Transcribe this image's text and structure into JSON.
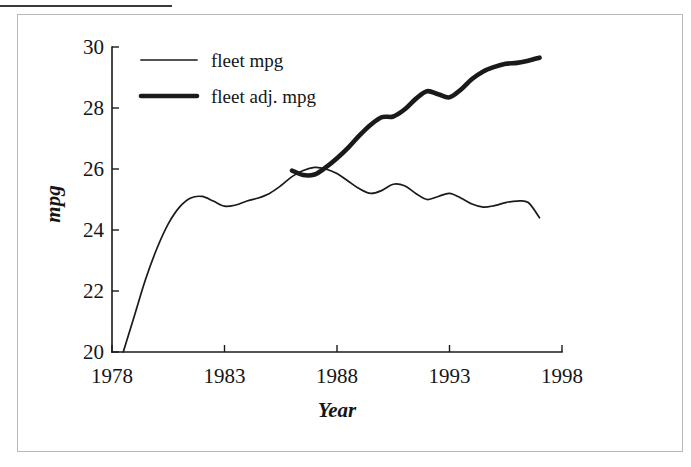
{
  "figure": {
    "background_color": "#ffffff",
    "frame_color": "#b9b9b9",
    "rule_color": "#3a3a3a",
    "ink_color": "#1a1a1a"
  },
  "legend": {
    "entries": [
      {
        "label": "fleet mpg",
        "style": "thin-line",
        "width_px": 1.7
      },
      {
        "label": "fleet adj. mpg",
        "style": "thick-line",
        "width_px": 4.6
      }
    ]
  },
  "axes": {
    "x_title": "Year",
    "y_title": "mpg",
    "x_ticks": [
      "1978",
      "1983",
      "1988",
      "1993",
      "1998"
    ],
    "y_ticks": [
      "20",
      "22",
      "24",
      "26",
      "28",
      "30"
    ]
  },
  "chart_data": {
    "type": "line",
    "title": "",
    "xlabel": "Year",
    "ylabel": "mpg",
    "xlim": [
      1978,
      1998
    ],
    "ylim": [
      20,
      30
    ],
    "xticks": [
      1978,
      1983,
      1988,
      1993,
      1998
    ],
    "yticks": [
      20,
      22,
      24,
      26,
      28,
      30
    ],
    "grid": false,
    "legend_position": "upper-left-inside",
    "series": [
      {
        "name": "fleet mpg",
        "line_width": "thin",
        "x": [
          1978.5,
          1979,
          1979.5,
          1980,
          1980.5,
          1981,
          1981.5,
          1982,
          1982.5,
          1983,
          1983.5,
          1984,
          1984.5,
          1985,
          1985.5,
          1986,
          1986.5,
          1987,
          1987.5,
          1988,
          1988.5,
          1989,
          1989.5,
          1990,
          1990.5,
          1991,
          1991.5,
          1992,
          1992.5,
          1993,
          1993.5,
          1994,
          1994.5,
          1995,
          1995.5,
          1996,
          1996.5,
          1997
        ],
        "y": [
          20.0,
          21.2,
          22.4,
          23.4,
          24.2,
          24.75,
          25.05,
          25.1,
          24.95,
          24.78,
          24.82,
          24.95,
          25.05,
          25.2,
          25.45,
          25.75,
          25.95,
          26.05,
          26.0,
          25.85,
          25.6,
          25.35,
          25.2,
          25.3,
          25.5,
          25.45,
          25.2,
          25.0,
          25.1,
          25.2,
          25.05,
          24.85,
          24.75,
          24.8,
          24.9,
          24.95,
          24.9,
          24.4
        ]
      },
      {
        "name": "fleet adj. mpg",
        "line_width": "thick",
        "x": [
          1986,
          1986.5,
          1987,
          1987.5,
          1988,
          1988.5,
          1989,
          1989.5,
          1990,
          1990.5,
          1991,
          1991.5,
          1992,
          1992.5,
          1993,
          1993.5,
          1994,
          1994.5,
          1995,
          1995.5,
          1996,
          1996.5,
          1997
        ],
        "y": [
          25.95,
          25.8,
          25.82,
          26.05,
          26.35,
          26.7,
          27.1,
          27.45,
          27.7,
          27.72,
          27.95,
          28.3,
          28.55,
          28.45,
          28.35,
          28.6,
          28.95,
          29.2,
          29.35,
          29.45,
          29.48,
          29.55,
          29.65
        ]
      }
    ]
  }
}
